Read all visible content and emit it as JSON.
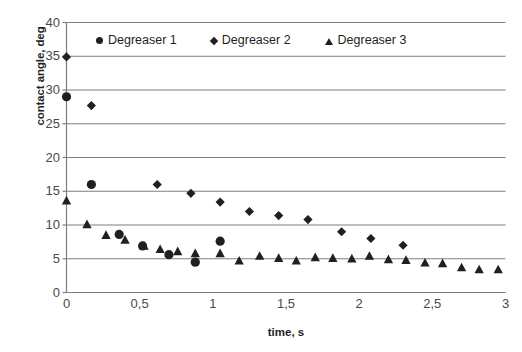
{
  "chart_data": {
    "type": "scatter",
    "title": "",
    "xlabel": "time, s",
    "ylabel": "contact angle, deg",
    "xlim": [
      0,
      3
    ],
    "ylim": [
      0,
      40
    ],
    "xticks": [
      0,
      0.5,
      1,
      1.5,
      2,
      2.5,
      3
    ],
    "xticklabels": [
      "0",
      "0,5",
      "1",
      "1,5",
      "2",
      "2,5",
      "3"
    ],
    "yticks": [
      0,
      5,
      10,
      15,
      20,
      25,
      30,
      35,
      40
    ],
    "yticklabels": [
      "0",
      "5",
      "10",
      "15",
      "20",
      "25",
      "30",
      "35",
      "40"
    ],
    "grid": "horizontal",
    "legend_position": "top-inside",
    "decimal_separator": ",",
    "series": [
      {
        "name": "Degreaser 1",
        "marker": "circle",
        "color": "#231f20",
        "points": [
          [
            0.0,
            29.0
          ],
          [
            0.17,
            16.0
          ],
          [
            0.36,
            8.6
          ],
          [
            0.52,
            6.9
          ],
          [
            0.7,
            5.6
          ],
          [
            0.88,
            4.5
          ],
          [
            1.05,
            7.6
          ]
        ]
      },
      {
        "name": "Degreaser 2",
        "marker": "diamond",
        "color": "#231f20",
        "points": [
          [
            0.0,
            34.9
          ],
          [
            0.17,
            27.7
          ],
          [
            0.62,
            16.0
          ],
          [
            0.85,
            14.7
          ],
          [
            1.05,
            13.4
          ],
          [
            1.25,
            12.0
          ],
          [
            1.45,
            11.4
          ],
          [
            1.65,
            10.8
          ],
          [
            1.88,
            9.0
          ],
          [
            2.08,
            8.0
          ],
          [
            2.3,
            7.0
          ]
        ]
      },
      {
        "name": "Degreaser 3",
        "marker": "triangle",
        "color": "#231f20",
        "points": [
          [
            0.0,
            13.6
          ],
          [
            0.14,
            10.1
          ],
          [
            0.27,
            8.5
          ],
          [
            0.4,
            7.8
          ],
          [
            0.53,
            6.9
          ],
          [
            0.64,
            6.4
          ],
          [
            0.76,
            6.1
          ],
          [
            0.88,
            5.8
          ],
          [
            1.05,
            5.8
          ],
          [
            1.18,
            4.7
          ],
          [
            1.32,
            5.4
          ],
          [
            1.45,
            5.1
          ],
          [
            1.57,
            4.7
          ],
          [
            1.7,
            5.2
          ],
          [
            1.82,
            5.1
          ],
          [
            1.95,
            5.0
          ],
          [
            2.07,
            5.4
          ],
          [
            2.2,
            4.9
          ],
          [
            2.32,
            4.8
          ],
          [
            2.45,
            4.4
          ],
          [
            2.57,
            4.3
          ],
          [
            2.7,
            3.7
          ],
          [
            2.82,
            3.4
          ],
          [
            2.95,
            3.4
          ]
        ]
      }
    ]
  },
  "legend": {
    "entries": [
      {
        "label": "Degreaser 1",
        "marker": "circle-marker"
      },
      {
        "label": "Degreaser 2",
        "marker": "diamond-marker"
      },
      {
        "label": "Degreaser 3",
        "marker": "triangle-marker"
      }
    ]
  },
  "colors": {
    "marker": "#231f20",
    "gridline": "#7f7f7f",
    "axis": "#7f7f7f",
    "tick_text": "#4a4a4a",
    "title_text": "#231f20",
    "background": "#ffffff"
  }
}
